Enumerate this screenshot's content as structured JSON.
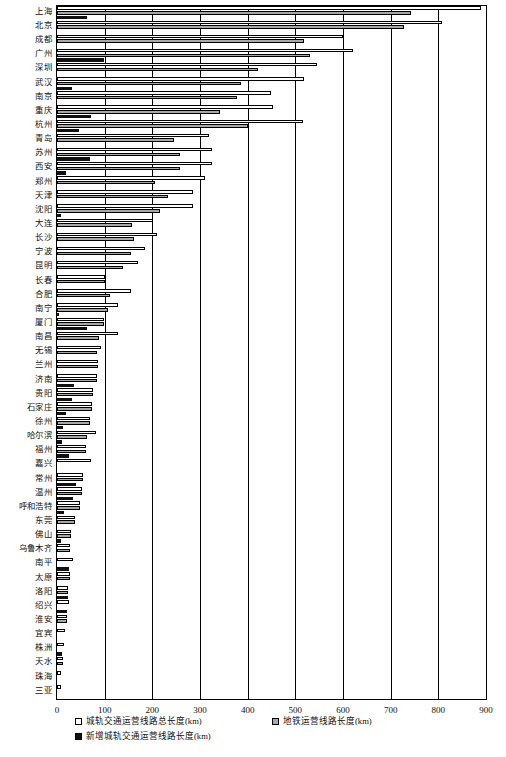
{
  "chart_data": {
    "type": "bar",
    "orientation": "horizontal",
    "title": "",
    "xlabel": "",
    "ylabel": "",
    "xlim": [
      0,
      900
    ],
    "xticks": [
      0,
      100,
      200,
      300,
      400,
      500,
      600,
      700,
      800,
      900
    ],
    "grid": true,
    "legend_position": "bottom",
    "categories": [
      "上海",
      "北京",
      "成都",
      "广州",
      "深圳",
      "武汉",
      "南京",
      "重庆",
      "杭州",
      "青岛",
      "苏州",
      "西安",
      "郑州",
      "天津",
      "沈阳",
      "大连",
      "长沙",
      "宁波",
      "昆明",
      "长春",
      "合肥",
      "南宁",
      "厦门",
      "南昌",
      "无锡",
      "兰州",
      "济南",
      "贵阳",
      "石家庄",
      "徐州",
      "哈尔滨",
      "福州",
      "嘉兴",
      "常州",
      "温州",
      "呼和浩特",
      "东莞",
      "佛山",
      "乌鲁木齐",
      "南平",
      "太原",
      "洛阳",
      "绍兴",
      "淮安",
      "宜宾",
      "株洲",
      "天水",
      "珠海",
      "三亚"
    ],
    "series": [
      {
        "name": "城轨交通运营线路总长度(km)",
        "color": "#ffffff",
        "values": [
          890,
          807,
          601,
          621,
          546,
          518,
          448,
          454,
          516,
          318,
          325,
          325,
          311,
          286,
          286,
          201,
          209,
          185,
          169,
          100,
          156,
          128,
          98,
          128,
          92,
          86,
          84,
          75,
          74,
          70,
          82,
          60,
          71,
          54,
          53,
          49,
          38,
          30,
          27,
          34,
          28,
          24,
          25,
          20,
          17,
          14,
          13,
          9,
          8
        ]
      },
      {
        "name": "地铁运营线路长度(km)",
        "color": "#a8a8a8",
        "values": [
          743,
          727,
          518,
          531,
          422,
          387,
          378,
          343,
          400,
          246,
          258,
          259,
          206,
          233,
          216,
          157,
          161,
          155,
          139,
          100,
          112,
          108,
          98,
          89,
          84,
          86,
          84,
          75,
          74,
          70,
          62,
          60,
          0,
          54,
          53,
          49,
          38,
          30,
          27,
          0,
          28,
          24,
          0,
          20,
          0,
          0,
          13,
          0,
          0
        ]
      },
      {
        "name": "新增城轨交通运营线路长度(km)",
        "color": "#111111",
        "values": [
          62,
          0,
          0,
          98,
          0,
          31,
          0,
          72,
          47,
          0,
          69,
          18,
          0,
          0,
          9,
          0,
          0,
          0,
          0,
          0,
          0,
          5,
          62,
          0,
          0,
          0,
          36,
          31,
          19,
          13,
          10,
          26,
          0,
          39,
          33,
          14,
          0,
          8,
          0,
          26,
          0,
          23,
          22,
          0,
          0,
          10,
          0,
          0,
          0
        ]
      }
    ]
  },
  "axis": {
    "tick_labels": [
      "0",
      "100",
      "200",
      "300",
      "400",
      "500",
      "600",
      "700",
      "800",
      "900"
    ]
  },
  "legend": {
    "items": [
      {
        "label": "城轨交通运营线路总长度(km)",
        "swatch": "white-square-icon"
      },
      {
        "label": "地铁运营线路长度(km)",
        "swatch": "gray-square-icon"
      },
      {
        "label": "新增城轨交通运营线路长度(km)",
        "swatch": "black-square-icon"
      }
    ]
  }
}
